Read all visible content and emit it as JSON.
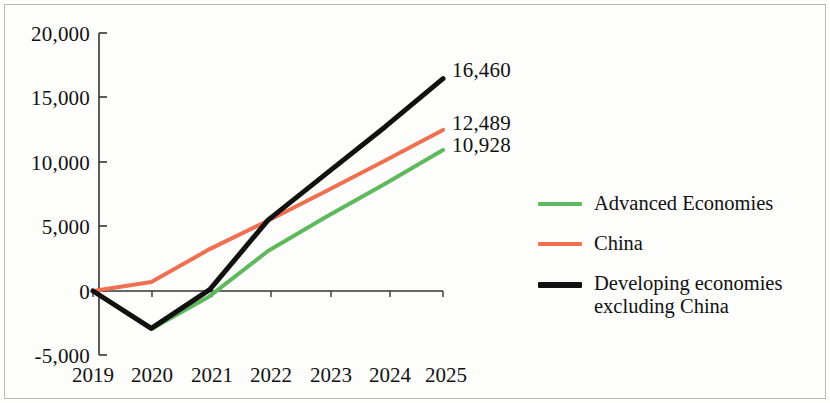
{
  "chart_data": {
    "type": "line",
    "title": "",
    "subtitle": "",
    "xlabel": "",
    "ylabel": "",
    "categories": [
      "2019",
      "2020",
      "2021",
      "2022",
      "2023",
      "2024",
      "2025"
    ],
    "x": [
      2019,
      2020,
      2021,
      2022,
      2023,
      2024,
      2025
    ],
    "xlim": [
      2019,
      2025
    ],
    "ylim": [
      -5000,
      20000
    ],
    "yticks": [
      -5000,
      0,
      5000,
      10000,
      15000,
      20000
    ],
    "ytick_labels": [
      "-5,000",
      "0",
      "5,000",
      "10,000",
      "15,000",
      "20,000"
    ],
    "grid": false,
    "legend_position": "right",
    "series": [
      {
        "name": "Advanced Economies",
        "color": "#5FB85C",
        "width": 4,
        "values": [
          0,
          -2950,
          -400,
          3100,
          5750,
          8300,
          10928
        ],
        "end_label": "10,928"
      },
      {
        "name": "China",
        "color": "#EE7050",
        "width": 4,
        "values": [
          0,
          700,
          3250,
          5450,
          7750,
          10100,
          12489
        ],
        "end_label": "12,489"
      },
      {
        "name": "Developing economies excluding China",
        "color": "#111111",
        "width": 5,
        "values": [
          0,
          -2900,
          100,
          5500,
          9100,
          12700,
          16460
        ],
        "end_label": "16,460"
      }
    ],
    "annotations": [
      {
        "text": "16,460",
        "series": "Developing economies excluding China",
        "x": 2025,
        "y": 16460
      },
      {
        "text": "12,489",
        "series": "China",
        "x": 2025,
        "y": 12489
      },
      {
        "text": "10,928",
        "series": "Advanced Economies",
        "x": 2025,
        "y": 10928
      }
    ]
  },
  "legend": {
    "items": [
      {
        "label": "Advanced Economies",
        "color": "#5FB85C"
      },
      {
        "label": "China",
        "color": "#EE7050"
      },
      {
        "label": "Developing economies excluding China",
        "color": "#111111"
      }
    ]
  }
}
